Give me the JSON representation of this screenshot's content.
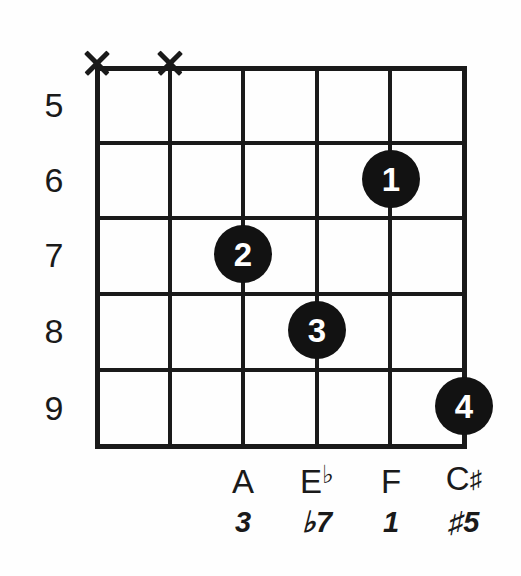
{
  "diagram": {
    "type": "guitar-chord-diagram",
    "strings_count": 6,
    "frets_shown": 5,
    "ink_color": "#1a1a1a",
    "dot_color": "#121212",
    "dot_text_color": "#ffffff",
    "background_color": "#ffffff"
  },
  "fret_numbers": [
    {
      "label": "5"
    },
    {
      "label": "6"
    },
    {
      "label": "7"
    },
    {
      "label": "8"
    },
    {
      "label": "9"
    }
  ],
  "muted_strings": [
    {
      "marker": "X",
      "string_index": 0
    },
    {
      "marker": "X",
      "string_index": 1
    }
  ],
  "finger_dots": [
    {
      "label": "1",
      "string_index": 4,
      "fret_label": "6"
    },
    {
      "label": "2",
      "string_index": 2,
      "fret_label": "7"
    },
    {
      "label": "3",
      "string_index": 3,
      "fret_label": "8"
    },
    {
      "label": "4",
      "string_index": 5,
      "fret_label": "9"
    }
  ],
  "note_labels": [
    {
      "name": "A",
      "accidental": ""
    },
    {
      "name": "E",
      "accidental": "♭"
    },
    {
      "name": "F",
      "accidental": ""
    },
    {
      "name": "C",
      "accidental": "♯"
    }
  ],
  "interval_labels": [
    {
      "text": "3"
    },
    {
      "text": "♭7"
    },
    {
      "text": "1"
    },
    {
      "text": "♯5"
    }
  ]
}
